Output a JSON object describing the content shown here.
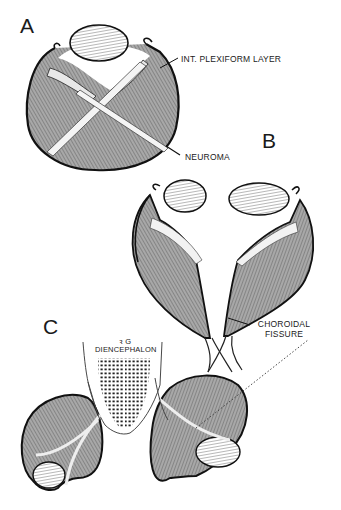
{
  "figure": {
    "panels": [
      {
        "letter": "A"
      },
      {
        "letter": "B"
      },
      {
        "letter": "C"
      }
    ],
    "labels": {
      "int_plexiform_layer": "INT. PLEXIFORM  LAYER",
      "neuroma": "NEUROMA",
      "choroidal_fissure_line1": "CHOROIDAL",
      "choroidal_fissure_line2": "FISSURE",
      "diencephalon_mark": "ꝛ G",
      "diencephalon": "DIENCEPHALON"
    },
    "colors": {
      "ink": "#1a1a1a",
      "hatch_fill": "#9a9a9a",
      "lens_fill": "#ffffff",
      "background": "#ffffff"
    }
  }
}
